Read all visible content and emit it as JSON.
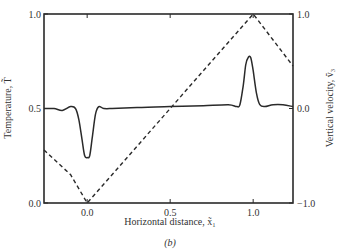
{
  "chart_data": {
    "type": "line",
    "title": "",
    "caption": "(b)",
    "xlabel": "Horizontal distance, x̃₁",
    "ylabel_left": "Temperature, T̃",
    "ylabel_right": "Vertical velocity, ṽ₃",
    "xlim": [
      -0.26,
      1.24
    ],
    "ylim_left": [
      0.0,
      1.0
    ],
    "ylim_right": [
      -1.0,
      1.0
    ],
    "xticks": [
      0.0,
      0.5,
      1.0
    ],
    "xtick_labels": [
      "0.0",
      "0.5",
      "1.0"
    ],
    "yticks_left": [
      0.0,
      0.5,
      1.0
    ],
    "ytick_labels_left": [
      "0.0",
      "0.5",
      "1.0"
    ],
    "yticks_right": [
      -1.0,
      0.0,
      1.0
    ],
    "ytick_labels_right": [
      "−1.0",
      "0.0",
      "1.0"
    ],
    "grid": false,
    "legend": null,
    "series": [
      {
        "name": "Temperature",
        "axis": "left",
        "style": "solid",
        "x": [
          -0.26,
          -0.2,
          -0.15,
          -0.1,
          -0.07,
          -0.05,
          -0.03,
          -0.015,
          0.0,
          0.015,
          0.03,
          0.05,
          0.07,
          0.1,
          0.15,
          0.3,
          0.5,
          0.7,
          0.85,
          0.9,
          0.92,
          0.94,
          0.955,
          0.97,
          0.985,
          1.0,
          1.02,
          1.04,
          1.07,
          1.12,
          1.18,
          1.24
        ],
        "values": [
          0.5,
          0.5,
          0.49,
          0.51,
          0.5,
          0.44,
          0.33,
          0.25,
          0.24,
          0.25,
          0.34,
          0.47,
          0.51,
          0.5,
          0.5,
          0.505,
          0.51,
          0.515,
          0.52,
          0.51,
          0.52,
          0.62,
          0.73,
          0.77,
          0.77,
          0.7,
          0.58,
          0.52,
          0.51,
          0.52,
          0.52,
          0.51
        ]
      },
      {
        "name": "Vertical velocity",
        "axis": "right",
        "style": "dashed",
        "x": [
          -0.26,
          -0.1,
          0.0,
          0.5,
          1.0,
          1.24
        ],
        "values": [
          -0.44,
          -0.7,
          -1.0,
          0.0,
          1.0,
          0.45
        ]
      }
    ]
  }
}
